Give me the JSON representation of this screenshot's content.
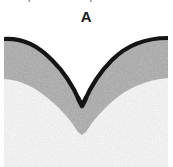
{
  "figure": {
    "panel_label": "A",
    "top_crop_remnants": {
      "left_fragment": "l",
      "right_fragment": "T"
    }
  },
  "micrograph": {
    "description": "cross-section of a v-shaped groove",
    "layers": [
      {
        "name": "surface-line",
        "label": "dark surface coating line",
        "color": "#141414",
        "thickness_px": 4
      },
      {
        "name": "gray-band",
        "label": "intermediate gray layer",
        "color": "#a9a9a9"
      },
      {
        "name": "speckled-substrate",
        "label": "light speckled substrate",
        "color": "#e9e9e9",
        "speckle_color": "#fdfdfd"
      },
      {
        "name": "groove-void",
        "label": "open v-shaped groove",
        "color": "#ffffff"
      }
    ],
    "groove": {
      "apex_x_px": 78,
      "apex_y_px": 68,
      "opening_left_x_px": 4,
      "opening_right_x_px": 160
    }
  }
}
